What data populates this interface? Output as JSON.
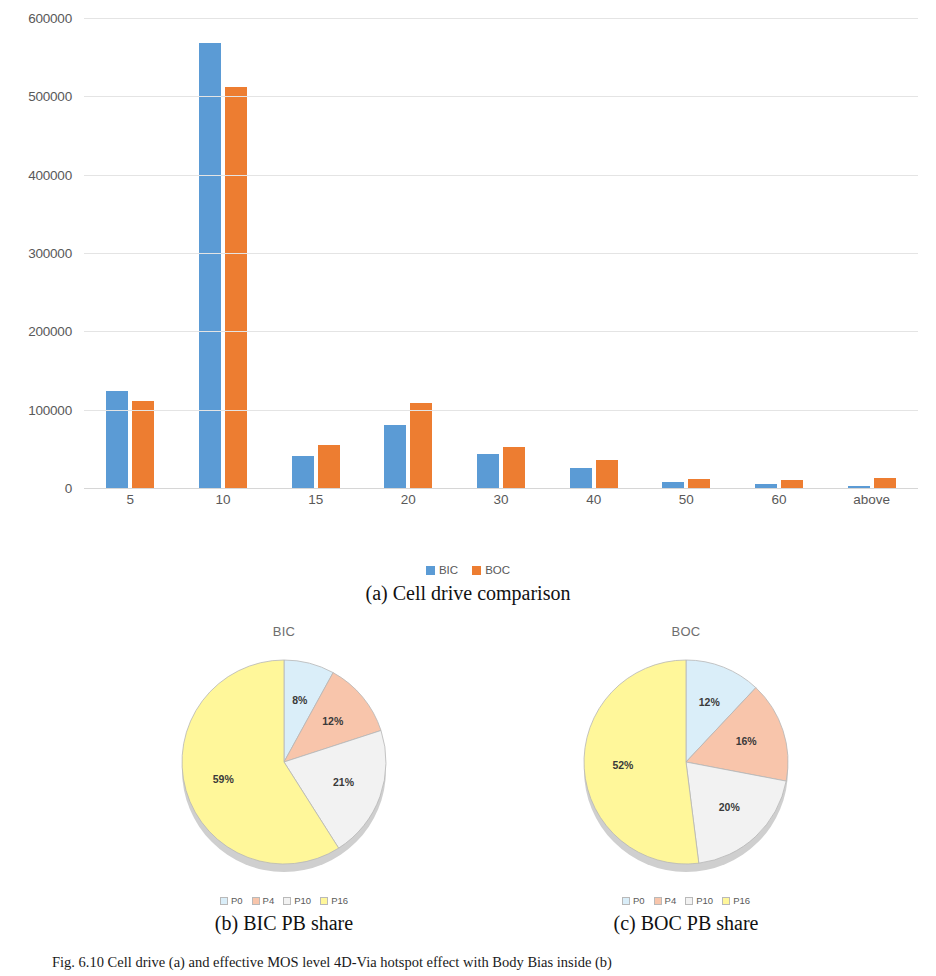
{
  "figure": {
    "caption": "Fig. 6.10 Cell drive (a) and effective MOS level 4D-Via hotspot effect with Body Bias inside (b)"
  },
  "subcaptions": {
    "a": "(a) Cell drive comparison",
    "b": "(b) BIC PB share",
    "c": "(c) BOC PB share"
  },
  "colors": {
    "bic": "#5B9BD5",
    "boc": "#ED7D31",
    "p0": "#DAEEF9",
    "p4": "#F8C5AB",
    "p10": "#F2F2F2",
    "p16": "#FFF79A"
  },
  "chart_data": [
    {
      "type": "bar",
      "title": "",
      "id": "cell-drive-comparison",
      "xlabel": "",
      "ylabel": "",
      "categories": [
        "5",
        "10",
        "15",
        "20",
        "30",
        "40",
        "50",
        "60",
        "above"
      ],
      "ylim": [
        0,
        600000
      ],
      "yticks": [
        "0",
        "100000",
        "200000",
        "300000",
        "400000",
        "500000",
        "600000"
      ],
      "grid": true,
      "legend_position": "bottom",
      "series": [
        {
          "name": "BIC",
          "color": "#5B9BD5",
          "values": [
            124000,
            568000,
            41000,
            80000,
            43000,
            26000,
            8000,
            5000,
            2000
          ]
        },
        {
          "name": "BOC",
          "color": "#ED7D31",
          "values": [
            111000,
            512000,
            55000,
            108000,
            52000,
            36000,
            12000,
            10000,
            13000
          ]
        }
      ]
    },
    {
      "type": "pie",
      "id": "bic-pb-share",
      "title": "BIC",
      "legend_position": "bottom",
      "labels": [
        "P0",
        "P4",
        "P10",
        "P16"
      ],
      "values": [
        8,
        12,
        21,
        59
      ],
      "value_labels": [
        "8%",
        "12%",
        "21%",
        "59%"
      ],
      "colors": [
        "#DAEEF9",
        "#F8C5AB",
        "#F2F2F2",
        "#FFF79A"
      ]
    },
    {
      "type": "pie",
      "id": "boc-pb-share",
      "title": "BOC",
      "legend_position": "bottom",
      "labels": [
        "P0",
        "P4",
        "P10",
        "P16"
      ],
      "values": [
        12,
        16,
        20,
        52
      ],
      "value_labels": [
        "12%",
        "16%",
        "20%",
        "52%"
      ],
      "colors": [
        "#DAEEF9",
        "#F8C5AB",
        "#F2F2F2",
        "#FFF79A"
      ]
    }
  ]
}
